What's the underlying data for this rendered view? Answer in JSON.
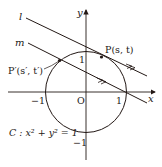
{
  "diagram": {
    "type": "coordinate-geometry",
    "axes": {
      "x_label": "x",
      "y_label": "y",
      "origin_label": "O",
      "ticks": {
        "x_neg": "−1",
        "x_pos": "1",
        "y_pos": "1",
        "y_neg": "−1"
      }
    },
    "circle": {
      "label": "C : x² + y² = 1",
      "center": [
        0,
        0
      ],
      "radius": 1
    },
    "lines": [
      {
        "name": "l",
        "label": "l"
      },
      {
        "name": "m",
        "label": "m"
      }
    ],
    "points": [
      {
        "name": "P",
        "label": "P(s, t)"
      },
      {
        "name": "P'",
        "label": "P′(s′, t′)"
      }
    ],
    "colors": {
      "stroke": "#231815",
      "background": "#ffffff"
    }
  }
}
